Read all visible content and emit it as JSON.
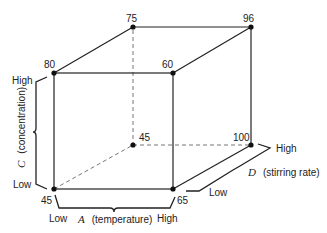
{
  "diagram": {
    "type": "cube-factorial-design",
    "vertices": {
      "front_bottom_left": {
        "value": "45",
        "x": 54,
        "y": 189
      },
      "front_bottom_right": {
        "value": "65",
        "x": 173,
        "y": 189
      },
      "front_top_left": {
        "value": "80",
        "x": 54,
        "y": 73
      },
      "front_top_right": {
        "value": "60",
        "x": 173,
        "y": 73
      },
      "back_top_left": {
        "value": "75",
        "x": 133,
        "y": 27
      },
      "back_top_right": {
        "value": "96",
        "x": 251,
        "y": 27
      },
      "back_bottom_left": {
        "value": "45",
        "x": 133,
        "y": 145
      },
      "back_bottom_right": {
        "value": "100",
        "x": 251,
        "y": 145
      }
    },
    "axes": {
      "A": {
        "letter": "A",
        "name": "(temperature)",
        "low": "Low",
        "high": "High"
      },
      "C": {
        "letter": "C",
        "name": "(concentration)",
        "low": "Low",
        "high": "High"
      },
      "D": {
        "letter": "D",
        "name": "(stirring rate)",
        "low": "Low",
        "high": "High"
      }
    },
    "colors": {
      "line": "#222222",
      "hidden_line": "#777777",
      "background": "#ffffff"
    }
  }
}
